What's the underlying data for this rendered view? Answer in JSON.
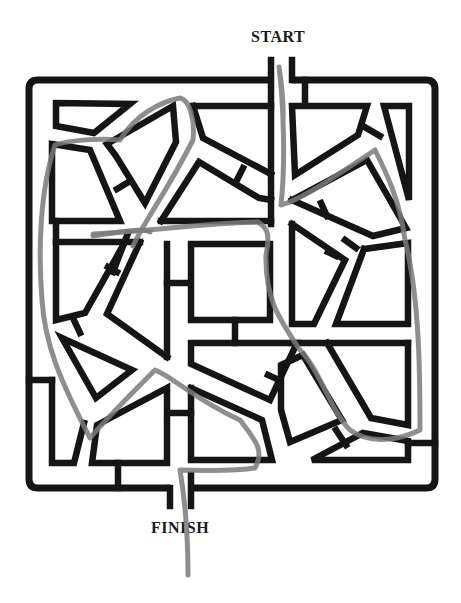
{
  "puzzle": {
    "type": "maze",
    "start_label": "START",
    "finish_label": "FINISH",
    "colors": {
      "background": "#ffffff",
      "walls": "#151515",
      "solution_path": "#7a7a7a",
      "text": "#1a1a1a"
    },
    "solution_drawn": true
  }
}
